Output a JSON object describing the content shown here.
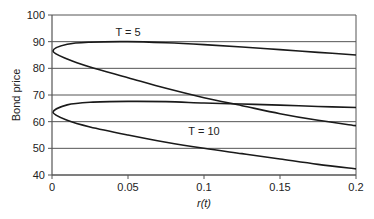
{
  "chart_data": {
    "type": "line",
    "title": "",
    "xlabel": "r(t)",
    "ylabel": "Bond price",
    "xlim": [
      0,
      0.2
    ],
    "ylim": [
      40,
      100
    ],
    "xticks": [
      "0",
      "0.05",
      "0.1",
      "0.15",
      "0.2"
    ],
    "yticks": [
      "40",
      "50",
      "60",
      "70",
      "80",
      "90",
      "100"
    ],
    "grid": "horizontal",
    "legend": "none",
    "annotations": [
      {
        "text": "T = 5",
        "x": 0.05,
        "y": 92
      },
      {
        "text": "T = 10",
        "x": 0.1,
        "y": 55
      }
    ],
    "series": [
      {
        "name": "T = 5 upper",
        "x": [
          0,
          0.01,
          0.025,
          0.05,
          0.075,
          0.1,
          0.125,
          0.15,
          0.175,
          0.2
        ],
        "values": [
          86.5,
          89.0,
          89.8,
          90.0,
          89.6,
          88.9,
          88.0,
          87.0,
          86.0,
          85.0
        ]
      },
      {
        "name": "T = 5 lower",
        "x": [
          0,
          0.01,
          0.025,
          0.05,
          0.075,
          0.1,
          0.125,
          0.15,
          0.175,
          0.2
        ],
        "values": [
          86.5,
          83.5,
          80.5,
          76.5,
          72.5,
          69.0,
          66.0,
          63.0,
          60.5,
          58.5
        ]
      },
      {
        "name": "T = 10 upper",
        "x": [
          0,
          0.01,
          0.025,
          0.05,
          0.075,
          0.1,
          0.125,
          0.15,
          0.175,
          0.2
        ],
        "values": [
          63.5,
          66.3,
          67.3,
          67.6,
          67.5,
          67.0,
          66.6,
          66.2,
          65.7,
          65.3
        ]
      },
      {
        "name": "T = 10 lower",
        "x": [
          0,
          0.01,
          0.025,
          0.05,
          0.075,
          0.1,
          0.125,
          0.15,
          0.175,
          0.2
        ],
        "values": [
          63.5,
          60.5,
          58.0,
          55.0,
          52.3,
          50.0,
          48.0,
          46.0,
          44.0,
          42.3
        ]
      }
    ]
  }
}
